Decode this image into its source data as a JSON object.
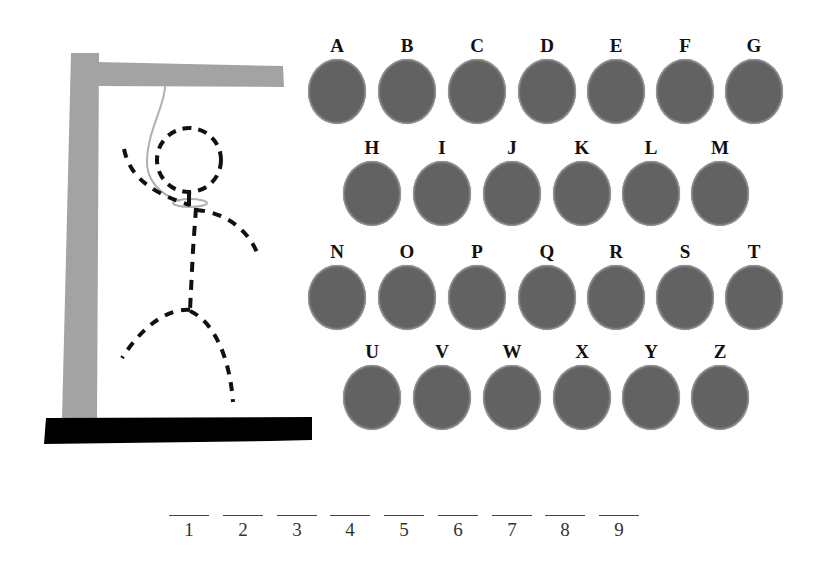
{
  "game": {
    "title": "Hangman",
    "colors": {
      "gallows": "#a3a3a3",
      "base": "#000000",
      "rope": "#b0b0b0",
      "figure": "#111111",
      "letter_circle": "#626262"
    }
  },
  "letters": {
    "rows": [
      [
        "A",
        "B",
        "C",
        "D",
        "E",
        "F",
        "G"
      ],
      [
        "H",
        "I",
        "J",
        "K",
        "L",
        "M"
      ],
      [
        "N",
        "O",
        "P",
        "Q",
        "R",
        "S",
        "T"
      ],
      [
        "U",
        "V",
        "W",
        "X",
        "Y",
        "Z"
      ]
    ]
  },
  "word": {
    "length": 9,
    "slots": [
      "1",
      "2",
      "3",
      "4",
      "5",
      "6",
      "7",
      "8",
      "9"
    ]
  }
}
